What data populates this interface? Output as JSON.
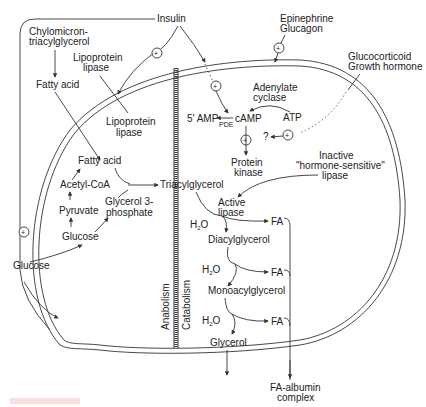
{
  "diagram": {
    "labels": {
      "insulin": "Insulin",
      "chylomicron_1": "Chylomicron-",
      "chylomicron_2": "triacylglycerol",
      "lpl_outer_1": "Lipoprotein",
      "lpl_outer_2": "lipase",
      "fatty_acid_outer": "Fatty acid",
      "lpl_inner_1": "Lipoprotein",
      "lpl_inner_2": "lipase",
      "epinephrine": "Epinephrine",
      "glucagon": "Glucagon",
      "glucocorticoid": "Glucocorticoid",
      "growth_hormone": "Growth hormone",
      "adenylate_1": "Adenylate",
      "adenylate_2": "cyclase",
      "atp": "ATP",
      "amp": "5′ AMP",
      "pde": "PDE",
      "camp": "cAMP",
      "question": "?",
      "protein_kinase_1": "Protein",
      "protein_kinase_2": "kinase",
      "inactive_1": "Inactive",
      "inactive_2": "\"hormone-sensitive\"",
      "inactive_3": "lipase",
      "fatty_acid_inner": "Fatty acid",
      "acetyl_coa": "Acetyl-CoA",
      "pyruvate": "Pyruvate",
      "glucose_inner": "Glucose",
      "glycerol3p_1": "Glycerol 3-",
      "glycerol3p_2": "phosphate",
      "glucose_outer": "Glucose",
      "triacylglycerol": "Triacylglycerol",
      "active_lipase_1": "Active",
      "active_lipase_2": "lipase",
      "h2o_1": "H",
      "h2o_2": "H",
      "h2o_3": "H",
      "h2o_sub": "2",
      "h2o_o": "O",
      "diacylglycerol": "Diacylglycerol",
      "monoacylglycerol": "Monoacylglycerol",
      "glycerol": "Glycerol",
      "fa_1": "FA",
      "fa_2": "FA",
      "fa_3": "FA",
      "fa_albumin_1": "FA-albumin",
      "fa_albumin_2": "complex",
      "anabolism": "Anabolism",
      "catabolism": "Catabolism",
      "plus": "+"
    },
    "colors": {
      "line": "#333333",
      "text": "#222222",
      "background": "#ffffff",
      "figure_label": "#f7c9c9"
    }
  }
}
